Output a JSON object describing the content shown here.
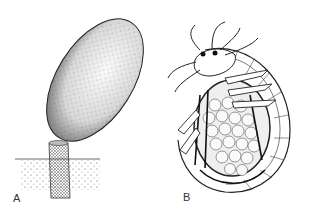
{
  "figure": {
    "panels": [
      {
        "label": "A",
        "subject": "stalked oval egg capsule rising from sediment"
      },
      {
        "label": "B",
        "subject": "amphipod crustacean curled around a brood mass of eggs"
      }
    ],
    "colors": {
      "ink": "#222222",
      "stipple": "#555555",
      "background": "#ffffff",
      "egg_fill": "#f4f4f4"
    }
  }
}
